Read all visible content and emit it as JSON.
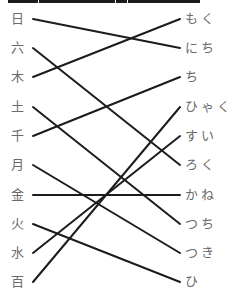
{
  "diagram": {
    "type": "matching",
    "left_items": [
      {
        "label": "日",
        "y": 19
      },
      {
        "label": "六",
        "y": 48
      },
      {
        "label": "木",
        "y": 77
      },
      {
        "label": "土",
        "y": 107
      },
      {
        "label": "千",
        "y": 136
      },
      {
        "label": "月",
        "y": 165
      },
      {
        "label": "金",
        "y": 195
      },
      {
        "label": "火",
        "y": 224
      },
      {
        "label": "水",
        "y": 253
      },
      {
        "label": "百",
        "y": 282
      }
    ],
    "right_items": [
      {
        "label": "もく",
        "y": 19
      },
      {
        "label": "にち",
        "y": 48
      },
      {
        "label": "ち",
        "y": 77
      },
      {
        "label": "ひゃく",
        "y": 107
      },
      {
        "label": "すい",
        "y": 136
      },
      {
        "label": "ろく",
        "y": 165
      },
      {
        "label": "かね",
        "y": 195
      },
      {
        "label": "つち",
        "y": 224
      },
      {
        "label": "つき",
        "y": 253
      },
      {
        "label": "ひ",
        "y": 282
      }
    ],
    "connections": [
      {
        "from": "日",
        "to": "にち",
        "from_index": 0,
        "to_index": 1
      },
      {
        "from": "六",
        "to": "ろく",
        "from_index": 1,
        "to_index": 5
      },
      {
        "from": "木",
        "to": "もく",
        "from_index": 2,
        "to_index": 0
      },
      {
        "from": "土",
        "to": "つち",
        "from_index": 3,
        "to_index": 7
      },
      {
        "from": "千",
        "to": "ち",
        "from_index": 4,
        "to_index": 2
      },
      {
        "from": "月",
        "to": "つき",
        "from_index": 5,
        "to_index": 8
      },
      {
        "from": "金",
        "to": "かね",
        "from_index": 6,
        "to_index": 6
      },
      {
        "from": "火",
        "to": "ひ",
        "from_index": 7,
        "to_index": 9
      },
      {
        "from": "水",
        "to": "すい",
        "from_index": 8,
        "to_index": 4
      },
      {
        "from": "百",
        "to": "ひゃく",
        "from_index": 9,
        "to_index": 3
      }
    ],
    "line_color": "#1c1c1c",
    "label_color": "#6a6a6a",
    "line_x_start": 33,
    "line_x_end": 180
  }
}
